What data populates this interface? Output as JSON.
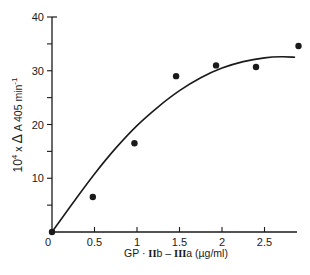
{
  "chart_data": {
    "type": "scatter",
    "title": "",
    "xlabel": "GP · IIb – IIIa (µg/ml)",
    "ylabel": "10⁴ × ΔA 405 min⁻¹",
    "xlim": [
      0,
      2.9
    ],
    "ylim": [
      0,
      40
    ],
    "x_ticks": [
      0,
      0.5,
      1,
      1.5,
      2,
      2.5
    ],
    "x_tick_labels": [
      "0",
      "0.5",
      "1",
      "1.5",
      "2",
      "2.5"
    ],
    "y_ticks": [
      0,
      5,
      10,
      15,
      20,
      25,
      30,
      35,
      40
    ],
    "y_tick_labels": [
      "",
      "",
      "10",
      "",
      "20",
      "",
      "30",
      "",
      "40"
    ],
    "grid": false,
    "legend": null,
    "series": [
      {
        "name": "measured",
        "style": "filled-circle",
        "points": [
          {
            "x": 0,
            "y": 0
          },
          {
            "x": 0.48,
            "y": 6.5
          },
          {
            "x": 0.97,
            "y": 16.5
          },
          {
            "x": 1.46,
            "y": 29.0
          },
          {
            "x": 1.93,
            "y": 31.0
          },
          {
            "x": 2.4,
            "y": 30.7
          },
          {
            "x": 2.9,
            "y": 34.6
          }
        ]
      },
      {
        "name": "fitted-curve",
        "style": "smooth-line",
        "points": [
          {
            "x": 0,
            "y": 0
          },
          {
            "x": 0.25,
            "y": 5.5
          },
          {
            "x": 0.5,
            "y": 10.8
          },
          {
            "x": 0.75,
            "y": 15.6
          },
          {
            "x": 1.0,
            "y": 19.8
          },
          {
            "x": 1.25,
            "y": 23.3
          },
          {
            "x": 1.5,
            "y": 26.3
          },
          {
            "x": 1.75,
            "y": 28.7
          },
          {
            "x": 2.0,
            "y": 30.5
          },
          {
            "x": 2.25,
            "y": 31.7
          },
          {
            "x": 2.5,
            "y": 32.4
          },
          {
            "x": 2.7,
            "y": 32.6
          },
          {
            "x": 2.86,
            "y": 32.5
          }
        ]
      }
    ]
  },
  "labels": {
    "x_origin": "0",
    "xlabel_prefix": "GP · ",
    "xlabel_roman1": "II",
    "xlabel_mid": "b – ",
    "xlabel_roman2": "III",
    "xlabel_suffix": "a (µg/ml)",
    "ylabel_base": "10",
    "ylabel_exp": "4",
    "ylabel_mid": " x ",
    "ylabel_delta": "Δ",
    "ylabel_rest": " A 405 min",
    "ylabel_exp2": "-1"
  },
  "colors": {
    "ink": "#1a1a1a",
    "background": "#ffffff"
  }
}
